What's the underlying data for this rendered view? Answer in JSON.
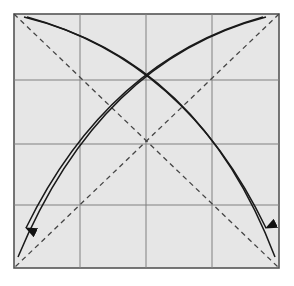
{
  "diagram": {
    "type": "origami-fold-diagram",
    "square": {
      "x": 14,
      "y": 14,
      "w": 265,
      "h": 254,
      "fill": "#e6e6e6",
      "stroke": "#555555"
    },
    "grid": {
      "divisions": 4,
      "vertical_x": [
        80,
        146,
        212
      ],
      "horizontal_y": [
        80,
        144,
        205
      ],
      "color": "#777777"
    },
    "diagonals": [
      {
        "name": "diagonal-tl-br",
        "from": [
          14,
          14
        ],
        "to": [
          279,
          268
        ],
        "style": "dashed"
      },
      {
        "name": "diagonal-tr-bl",
        "from": [
          279,
          14
        ],
        "to": [
          14,
          268
        ],
        "style": "dashed"
      }
    ],
    "arrows": [
      {
        "name": "fold-arrow-top-left-to-bottom-right",
        "direction": "top-left to bottom-right"
      },
      {
        "name": "fold-arrow-top-right-to-bottom-left",
        "direction": "top-right to bottom-left"
      }
    ],
    "colors": {
      "line": "#222222",
      "dash": "#444444",
      "background": "#ffffff"
    }
  }
}
